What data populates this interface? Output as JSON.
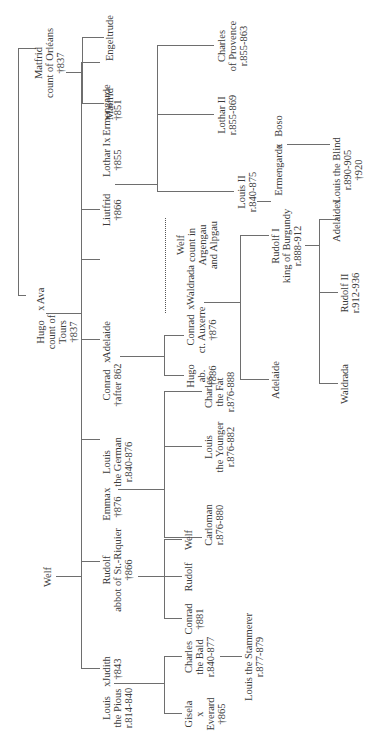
{
  "diagram": {
    "type": "genealogy-tree",
    "orientation": "rotated 90 degrees counter-clockwise",
    "marriage_symbol": "x",
    "people": {
      "welf": {
        "name": "Welf"
      },
      "matfrid_sr": {
        "name": "Matfrid",
        "line2": "count of Orléans",
        "line3": "†837"
      },
      "matfrid_jr": {
        "name": "Matfrid"
      },
      "engeltrude": {
        "name": "Engeltrude"
      },
      "hugo": {
        "name": "Hugo",
        "line2": "count of",
        "line3": "Tours",
        "line4": "†837"
      },
      "ava": {
        "name": "Ava"
      },
      "adelaide_hugo": {
        "name": "Adelaide"
      },
      "liutfrid": {
        "name": "Liutfrid",
        "line2": "†866"
      },
      "lothar_i": {
        "name": "Lothar I",
        "line2": "†855"
      },
      "ermengarde_851": {
        "name": "Ermengarde",
        "line2": "†851"
      },
      "charles_provence": {
        "name": "Charles",
        "line2": "of Provence",
        "line3": "r.855-863"
      },
      "lothar_ii": {
        "name": "Lothar II",
        "line2": "r.855-869"
      },
      "louis_ii": {
        "name": "Louis II",
        "line2": "r.840-875"
      },
      "ermengarde_boso": {
        "name": "Ermengarde"
      },
      "boso": {
        "name": "Boso"
      },
      "louis_blind": {
        "name": "Louis the Blind",
        "line2": "r.890-905",
        "line3": "†920"
      },
      "adelaide_rudolf": {
        "name": "Adelaide"
      },
      "welf_argengau": {
        "name": "Welf",
        "line2": "count in",
        "line3": "Argengau",
        "line4": "and Alpgau"
      },
      "waldrada_conrad": {
        "name": "Waldrada"
      },
      "conrad_auxerre": {
        "name": "Conrad",
        "line2": "ct. Auxerre",
        "line3": "†876"
      },
      "hugo_ab": {
        "name": "Hugo",
        "line2": "ab.",
        "line3": "†886"
      },
      "adelaide_conrad_child": {
        "name": "Adelaide"
      },
      "rudolf_i": {
        "name": "Rudolf I",
        "line2": "king of Burgundy",
        "line3": "r.888-912"
      },
      "rudolf_ii": {
        "name": "Rudolf II",
        "line2": "r.912-936"
      },
      "waldrada_rudolf": {
        "name": "Waldrada"
      },
      "conrad_862": {
        "name": "Conrad",
        "line2": "†after 862"
      },
      "emma": {
        "name": "Emma",
        "line2": "†876"
      },
      "louis_german": {
        "name": "Louis",
        "line2": "the German",
        "line3": "r.840-876"
      },
      "charles_fat": {
        "name": "Charles",
        "line2": "the Fat",
        "line3": "r.876-888"
      },
      "louis_younger": {
        "name": "Louis",
        "line2": "the Younger",
        "line3": "r.876-882"
      },
      "carloman": {
        "name": "Carloman",
        "line2": "r.876-880"
      },
      "rudolf_abbot": {
        "name": "Rudolf",
        "line2": "abbot of St.-Riquier",
        "line3": "†866"
      },
      "welf_son": {
        "name": "Welf"
      },
      "rudolf_son": {
        "name": "Rudolf"
      },
      "conrad_881": {
        "name": "Conrad",
        "line2": "†881"
      },
      "judith": {
        "name": "Judith",
        "line2": "†843"
      },
      "louis_pious": {
        "name": "Louis",
        "line2": "the Pious",
        "line3": "r.814-840"
      },
      "charles_bald": {
        "name": "Charles",
        "line2": "the Bald",
        "line3": "r.840-877"
      },
      "louis_stammerer": {
        "name": "Louis the Stammerer",
        "line2": "r.877-879"
      },
      "gisela": {
        "name": "Gisela",
        "line2": "x",
        "line3": "Everard",
        "line4": "†865"
      }
    },
    "colors": {
      "line": "#6e6e6e",
      "text": "#3a3a3a",
      "background": "#ffffff"
    }
  }
}
